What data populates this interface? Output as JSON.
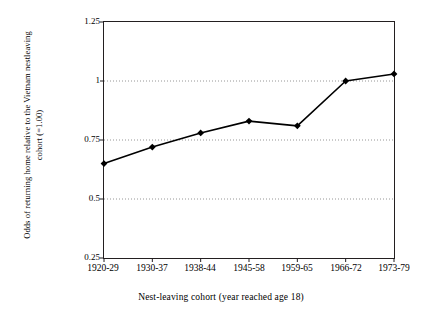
{
  "chart_data": {
    "type": "line",
    "title": "",
    "xlabel": "Nest-leaving cohort (year reached age 18)",
    "ylabel_line1": "Odds of returning home relative to the Vietnam nestleaving",
    "ylabel_line2": "cohort (=1.00)",
    "categories": [
      "1920-29",
      "1930-37",
      "1938-44",
      "1945-58",
      "1959-65",
      "1966-72",
      "1973-79"
    ],
    "values": [
      0.65,
      0.72,
      0.78,
      0.83,
      0.81,
      1.0,
      1.03
    ],
    "ylim": [
      0.25,
      1.25
    ],
    "yticks": [
      "0.25",
      "0.5",
      "0.75",
      "1",
      "1.25"
    ],
    "ytick_values": [
      0.25,
      0.5,
      0.75,
      1,
      1.25
    ],
    "grid": true,
    "grid_style": "dotted-horizontal",
    "legend": "none",
    "series_color": "#000000",
    "marker": "diamond",
    "marker_color": "#000000",
    "frame_color": "#231f20",
    "background": "#ffffff"
  }
}
